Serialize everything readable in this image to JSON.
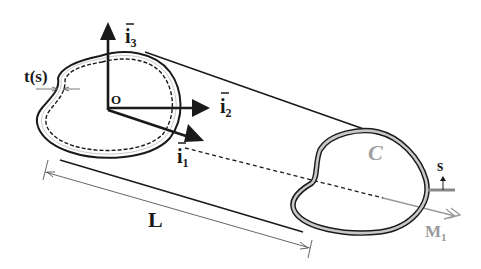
{
  "figure": {
    "labels": {
      "thickness": "t(s)",
      "origin": "O",
      "axis1": "i",
      "axis1_sub": "1",
      "axis2": "i",
      "axis2_sub": "2",
      "axis3": "i",
      "axis3_sub": "3",
      "length": "L",
      "contour": "C",
      "arc_coordinate": "s",
      "moment": "M",
      "moment_sub": "1"
    },
    "colors": {
      "line": "#1a1a1a",
      "wall_fill": "#c8c8c8",
      "contour_label": "#a0a0a0",
      "moment": "#9a9a9a",
      "dimension": "#555555"
    }
  }
}
